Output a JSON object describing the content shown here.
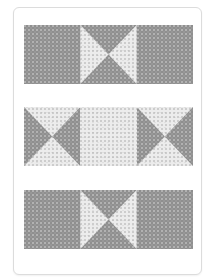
{
  "illustration": {
    "type": "quilt-layout",
    "fabrics": {
      "dark": "#8f8f8f",
      "light": "#ececec"
    },
    "card": {
      "border_color": "#dcdcdc",
      "background": "#ffffff"
    },
    "rows": [
      {
        "top": 25,
        "blocks": [
          {
            "kind": "solid",
            "fabric": "dark"
          },
          {
            "kind": "hourglass",
            "sides": "light",
            "topbottom": "dark"
          },
          {
            "kind": "solid",
            "fabric": "dark"
          }
        ]
      },
      {
        "top": 107,
        "blocks": [
          {
            "kind": "hourglass",
            "sides": "dark",
            "topbottom": "light"
          },
          {
            "kind": "solid",
            "fabric": "light"
          },
          {
            "kind": "hourglass",
            "sides": "dark",
            "topbottom": "light"
          }
        ]
      },
      {
        "top": 190,
        "blocks": [
          {
            "kind": "solid",
            "fabric": "dark"
          },
          {
            "kind": "hourglass",
            "sides": "light",
            "topbottom": "dark"
          },
          {
            "kind": "solid",
            "fabric": "dark"
          }
        ]
      }
    ]
  }
}
